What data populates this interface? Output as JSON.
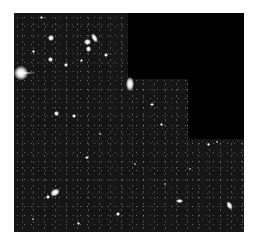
{
  "image": {
    "subject": "deep field of galaxies",
    "background_color": "#161616",
    "mask_color": "#000000",
    "page_background": "#ffffff"
  },
  "masks": [
    {
      "x": 114,
      "y": 0,
      "w": 116,
      "h": 66
    },
    {
      "x": 174,
      "y": 66,
      "w": 56,
      "h": 60
    }
  ],
  "objects": [
    {
      "x": 0,
      "y": 53,
      "w": 14,
      "h": 14,
      "r": 0
    },
    {
      "x": 112,
      "y": 64,
      "w": 8,
      "h": 14,
      "r": 0
    },
    {
      "x": 78,
      "y": 20,
      "w": 5,
      "h": 10,
      "r": -30
    },
    {
      "x": 34,
      "y": 22,
      "w": 6,
      "h": 6,
      "r": 0
    },
    {
      "x": 70,
      "y": 26,
      "w": 7,
      "h": 6,
      "r": 0
    },
    {
      "x": 72,
      "y": 33,
      "w": 5,
      "h": 6,
      "r": 0
    },
    {
      "x": 90,
      "y": 40,
      "w": 4,
      "h": 4,
      "r": 0
    },
    {
      "x": 34,
      "y": 44,
      "w": 5,
      "h": 5,
      "r": 0
    },
    {
      "x": 50,
      "y": 50,
      "w": 4,
      "h": 4,
      "r": 0
    },
    {
      "x": 18,
      "y": 37,
      "w": 3,
      "h": 3,
      "r": 0
    },
    {
      "x": 66,
      "y": 46,
      "w": 3,
      "h": 3,
      "r": 0
    },
    {
      "x": 26,
      "y": 3,
      "w": 3,
      "h": 3,
      "r": 0
    },
    {
      "x": 40,
      "y": 98,
      "w": 5,
      "h": 5,
      "r": 0
    },
    {
      "x": 58,
      "y": 101,
      "w": 4,
      "h": 4,
      "r": 0
    },
    {
      "x": 136,
      "y": 90,
      "w": 4,
      "h": 3,
      "r": 0
    },
    {
      "x": 146,
      "y": 110,
      "w": 3,
      "h": 3,
      "r": 0
    },
    {
      "x": 71,
      "y": 143,
      "w": 4,
      "h": 3,
      "r": 0
    },
    {
      "x": 36,
      "y": 176,
      "w": 10,
      "h": 7,
      "r": -30
    },
    {
      "x": 32,
      "y": 182,
      "w": 4,
      "h": 4,
      "r": 0
    },
    {
      "x": 102,
      "y": 199,
      "w": 4,
      "h": 4,
      "r": 0
    },
    {
      "x": 162,
      "y": 186,
      "w": 7,
      "h": 4,
      "r": 0
    },
    {
      "x": 213,
      "y": 188,
      "w": 5,
      "h": 9,
      "r": -30
    },
    {
      "x": 193,
      "y": 130,
      "w": 3,
      "h": 3,
      "r": 0
    },
    {
      "x": 202,
      "y": 128,
      "w": 2,
      "h": 2,
      "r": 0
    },
    {
      "x": 63,
      "y": 209,
      "w": 3,
      "h": 3,
      "r": 0
    },
    {
      "x": 18,
      "y": 205,
      "w": 2,
      "h": 2,
      "r": 0
    },
    {
      "x": 120,
      "y": 150,
      "w": 2,
      "h": 2,
      "r": 0
    },
    {
      "x": 175,
      "y": 155,
      "w": 2,
      "h": 2,
      "r": 0
    },
    {
      "x": 85,
      "y": 120,
      "w": 2,
      "h": 2,
      "r": 0
    },
    {
      "x": 150,
      "y": 170,
      "w": 2,
      "h": 2,
      "r": 0
    }
  ]
}
